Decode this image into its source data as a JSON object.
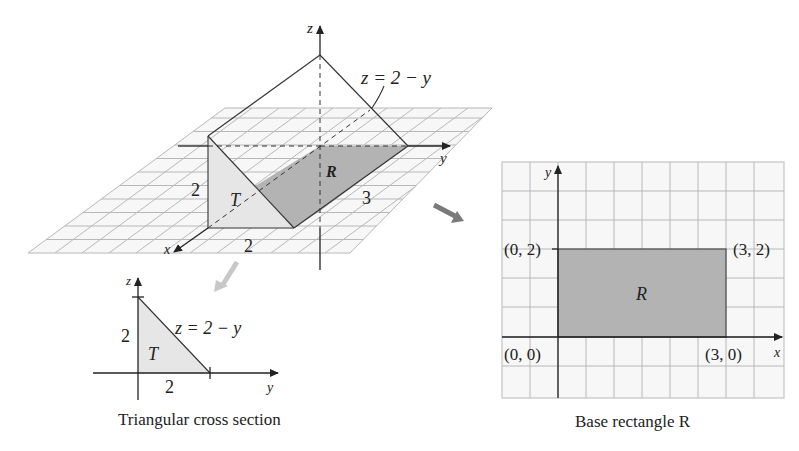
{
  "figure_3d": {
    "axis_labels": {
      "x": "x",
      "y": "y",
      "z": "z"
    },
    "surface_label": "z = 2 − y",
    "region_label": "R",
    "cross_section_label": "T",
    "dimension_height": "2",
    "dimension_width": "2",
    "dimension_length": "3"
  },
  "cross_section": {
    "axis_labels": {
      "y": "y",
      "z": "z"
    },
    "equation": "z = 2 − y",
    "region_label": "T",
    "height_label": "2",
    "base_label": "2",
    "caption": "Triangular cross section"
  },
  "base_rectangle": {
    "axis_labels": {
      "x": "x",
      "y": "y"
    },
    "region_label": "R",
    "corners": {
      "top_left": "(0, 2)",
      "top_right": "(3, 2)",
      "bottom_left": "(0, 0)",
      "bottom_right": "(3, 0)"
    },
    "caption": "Base rectangle R"
  },
  "colors": {
    "grid": "#b8b8b8",
    "shade_dark": "#b3b3b3",
    "shade_light": "#e6e6e6",
    "line": "#333333",
    "arrow_dark": "#7a7a7a",
    "arrow_light": "#c8c8c8"
  }
}
